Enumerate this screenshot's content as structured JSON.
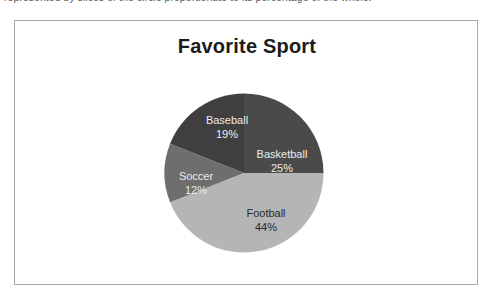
{
  "caption": {
    "text": "represented by slices of the circle proportionate to its percentage of the whole."
  },
  "figure": {
    "border_color": "#a8a8a8",
    "background": "#ffffff"
  },
  "chart_data": {
    "type": "pie",
    "title": "Favorite Sport",
    "xlabel": "",
    "ylabel": "",
    "legend": "none",
    "labels_inside_slices": true,
    "start_angle_deg": 0,
    "direction": "clockwise",
    "categories": [
      "Basketball",
      "Football",
      "Soccer",
      "Baseball"
    ],
    "values": [
      25,
      44,
      12,
      19
    ],
    "unit": "%",
    "slices": [
      {
        "name": "Basketball",
        "value": 25,
        "value_label": "25%",
        "color": "#4a4a4a",
        "label_color": "#ececeb",
        "start_deg": 0,
        "end_deg": 90,
        "label_x": 118,
        "label_y": 62
      },
      {
        "name": "Football",
        "value": 44,
        "value_label": "44%",
        "color": "#b5b5b5",
        "label_color": "#2b2b2b",
        "start_deg": 90,
        "end_deg": 248.4,
        "label_x": 102,
        "label_y": 121
      },
      {
        "name": "Soccer",
        "value": 12,
        "value_label": "12%",
        "color": "#6e6e6e",
        "label_color": "#ececeb",
        "start_deg": 248.4,
        "end_deg": 291.6,
        "label_x": 32,
        "label_y": 84
      },
      {
        "name": "Baseball",
        "value": 19,
        "value_label": "19%",
        "color": "#3f3f3f",
        "label_color": "#ececeb",
        "start_deg": 291.6,
        "end_deg": 360,
        "label_x": 63,
        "label_y": 28
      }
    ]
  }
}
